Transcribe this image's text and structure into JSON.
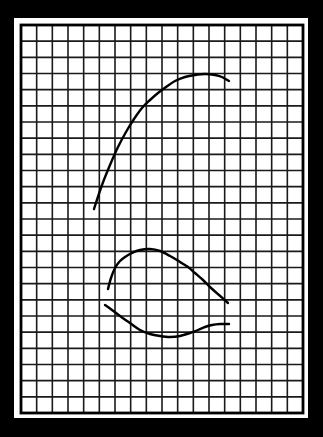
{
  "canvas": {
    "width": 323,
    "height": 437
  },
  "colors": {
    "background": "#000000",
    "paper": "#ffffff",
    "grid_line": "#1a1a1a",
    "frame": "#000000",
    "curve": "#000000"
  },
  "paper": {
    "x": 14,
    "y": 18,
    "width": 294,
    "height": 400
  },
  "grid": {
    "x": 21,
    "y": 25,
    "width": 282,
    "height": 388,
    "columns": 18,
    "rows": 24,
    "line_width": 1.6,
    "frame_width": 2.8
  },
  "curves": [
    {
      "name": "upper-arc",
      "stroke_width": 2.4,
      "points": [
        [
          94,
          209
        ],
        [
          102,
          185
        ],
        [
          110,
          165
        ],
        [
          118,
          147
        ],
        [
          126,
          132
        ],
        [
          134,
          119
        ],
        [
          142,
          108
        ],
        [
          150,
          100
        ],
        [
          158,
          93
        ],
        [
          166,
          87
        ],
        [
          175,
          81
        ],
        [
          185,
          77
        ],
        [
          195,
          75
        ],
        [
          205,
          74
        ],
        [
          215,
          75
        ],
        [
          222,
          77
        ],
        [
          229,
          81
        ]
      ]
    },
    {
      "name": "middle-arc",
      "stroke_width": 2.4,
      "points": [
        [
          108,
          289
        ],
        [
          111,
          278
        ],
        [
          115,
          268
        ],
        [
          120,
          261
        ],
        [
          125,
          257
        ],
        [
          132,
          253
        ],
        [
          140,
          250
        ],
        [
          150,
          249
        ],
        [
          160,
          251
        ],
        [
          170,
          256
        ],
        [
          180,
          262
        ],
        [
          188,
          267
        ],
        [
          195,
          273
        ],
        [
          203,
          280
        ],
        [
          210,
          287
        ],
        [
          219,
          295
        ],
        [
          228,
          303
        ]
      ]
    },
    {
      "name": "lower-curve",
      "stroke_width": 2.4,
      "points": [
        [
          105,
          305
        ],
        [
          112,
          310
        ],
        [
          120,
          316
        ],
        [
          130,
          323
        ],
        [
          140,
          330
        ],
        [
          150,
          334
        ],
        [
          160,
          336
        ],
        [
          170,
          337
        ],
        [
          180,
          336
        ],
        [
          190,
          333
        ],
        [
          198,
          330
        ],
        [
          205,
          327
        ],
        [
          212,
          325
        ],
        [
          220,
          324
        ],
        [
          229,
          324
        ]
      ]
    }
  ]
}
